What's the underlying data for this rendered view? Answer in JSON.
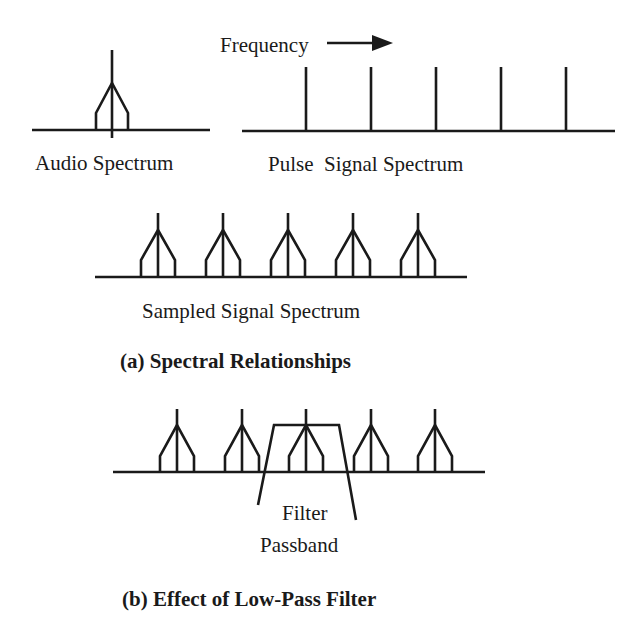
{
  "diagram": {
    "frequency_label": "Frequency",
    "audio_label": "Audio Spectrum",
    "pulse_label": "Pulse  Signal Spectrum",
    "sampled_label": "Sampled Signal Spectrum",
    "caption_a": "(a) Spectral Relationships",
    "filter_label_1": "Filter",
    "filter_label_2": "Passband",
    "caption_b": "(b) Effect of Low-Pass Filter",
    "line_color": "#1a1a1a",
    "background": "#ffffff",
    "audio": {
      "baseline_y": 130,
      "x_start": 32,
      "x_end": 210,
      "center_x": 112
    },
    "pulse": {
      "baseline_y": 131,
      "x_start": 242,
      "x_end": 615,
      "spikes_x": [
        306,
        371,
        436,
        501,
        566
      ],
      "top_y": 67
    },
    "sampled": {
      "baseline_y": 277,
      "x_start": 95,
      "x_end": 467,
      "centers_x": [
        158,
        223,
        288,
        353,
        418
      ]
    },
    "filtered": {
      "baseline_y": 472,
      "x_start": 113,
      "x_end": 485,
      "centers_x": [
        177,
        242,
        306,
        371,
        435
      ]
    }
  }
}
